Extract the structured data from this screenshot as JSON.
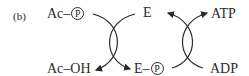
{
  "panel_label": "(b)",
  "left_cycle": {
    "top_left": {
      "prefix": "Ac–",
      "circled": "P"
    },
    "bottom_left": "Ac–OH"
  },
  "center": {
    "top": "E",
    "bottom": {
      "prefix": "E–",
      "circled": "P"
    }
  },
  "right_cycle": {
    "top_right": "ATP",
    "bottom_right": "ADP"
  },
  "colors": {
    "ink": "#2a2a2a",
    "background": "#ffffff"
  }
}
